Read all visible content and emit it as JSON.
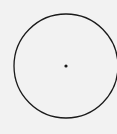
{
  "diagram": {
    "type": "circle-with-center",
    "background": "#f2f2f2",
    "stroke": "#1a1a1a",
    "circle": {
      "cx": 66,
      "cy": 66,
      "r": 52
    },
    "center_point": {
      "cx": 66,
      "cy": 66,
      "r": 1.6
    }
  }
}
